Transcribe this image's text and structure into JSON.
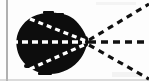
{
  "figure": {
    "description": "Scanned black-and-white figure: a solid dark teardrop-shaped blob on the left with white dashed rays converging to a focal point at its right tip, and black dashed rays diverging to the right.",
    "canvas": {
      "width": 149,
      "height": 81,
      "background_color": "#fdfdfd"
    },
    "colors": {
      "ink": "#0a0a0a",
      "paper": "#fdfdfd",
      "blob_fill": "#0d0d0d",
      "inner_dash": "#ffffff",
      "outer_dash": "#111111",
      "rule_line": "#7d7d7d",
      "bottom_rule": "#b9b9b9"
    },
    "focal_point": {
      "label": "focal point",
      "x": 87,
      "y": 42
    },
    "blob": {
      "label": "dark teardrop region",
      "left_x": 17,
      "right_x": 88,
      "top_y": 13,
      "bottom_y": 74
    },
    "rules": [
      {
        "name": "left-vertical-rule",
        "x1": 7,
        "y1": 0,
        "x2": 7,
        "y2": 81,
        "color": "#7d7d7d",
        "width": 1.2
      },
      {
        "name": "bottom-horizontal-rule",
        "x1": 0,
        "y1": 80,
        "x2": 149,
        "y2": 80,
        "color": "#b9b9b9",
        "width": 1
      }
    ],
    "inner_rays": [
      {
        "name": "inner-ray-upper",
        "x1": 30,
        "y1": 19,
        "x2": 86,
        "y2": 41,
        "color": "#ffffff",
        "width": 3.2,
        "dash": "5 4"
      },
      {
        "name": "inner-ray-axis",
        "x1": 12,
        "y1": 42,
        "x2": 87,
        "y2": 42,
        "color": "#ffffff",
        "width": 3.4,
        "dash": "6 4"
      },
      {
        "name": "inner-ray-lower",
        "x1": 30,
        "y1": 69,
        "x2": 86,
        "y2": 44,
        "color": "#ffffff",
        "width": 3.2,
        "dash": "5 4"
      }
    ],
    "outer_rays": [
      {
        "name": "outer-ray-upper",
        "x1": 89,
        "y1": 40,
        "x2": 149,
        "y2": 4,
        "color": "#111111",
        "width": 3.2,
        "dash": "6 5"
      },
      {
        "name": "outer-ray-axis",
        "x1": 89,
        "y1": 42,
        "x2": 149,
        "y2": 42,
        "color": "#111111",
        "width": 3.4,
        "dash": "7 5"
      },
      {
        "name": "outer-ray-lower",
        "x1": 89,
        "y1": 45,
        "x2": 149,
        "y2": 79,
        "color": "#111111",
        "width": 3.2,
        "dash": "6 5"
      }
    ]
  }
}
